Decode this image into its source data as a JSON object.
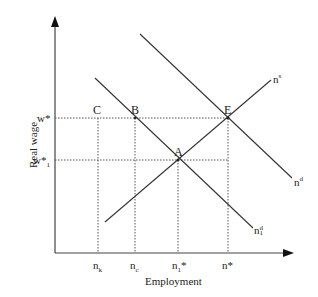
{
  "diagram": {
    "type": "labor-market-supply-demand",
    "axes": {
      "x_label": "Employment",
      "y_label": "Real wage"
    },
    "y_ticks": [
      {
        "base": "w*",
        "sub": "",
        "label": "w*"
      },
      {
        "base": "w*",
        "sub": "1",
        "label": "w*1"
      }
    ],
    "x_ticks": [
      {
        "base": "n",
        "sub": "k",
        "sup": "",
        "label": "nk"
      },
      {
        "base": "n",
        "sub": "c",
        "sup": "",
        "label": "nc"
      },
      {
        "base": "n",
        "sub": "1",
        "sup": "*",
        "label": "n1*"
      },
      {
        "base": "n*",
        "sub": "",
        "sup": "",
        "label": "n*"
      }
    ],
    "points": [
      "C",
      "B",
      "E",
      "A"
    ],
    "curves": [
      {
        "base": "n",
        "sup": "s",
        "sub": "",
        "label": "ns"
      },
      {
        "base": "n",
        "sup": "d",
        "sub": "",
        "label": "nd"
      },
      {
        "base": "n",
        "sup": "d",
        "sub": "1",
        "label": "n1d"
      }
    ],
    "colors": {
      "line": "#333333",
      "guide": "#555555"
    }
  }
}
